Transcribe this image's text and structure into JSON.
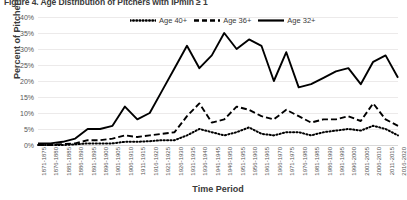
{
  "figure": {
    "title": "Figure 4. Age Distribution of Pitchers with IPmin ≥ 1"
  },
  "legend": {
    "position": "top-center",
    "entries": [
      {
        "label": "Age 40+",
        "style": "dotted",
        "color": "#000000"
      },
      {
        "label": "Age 36+",
        "style": "dashed",
        "color": "#000000"
      },
      {
        "label": "Age 32+",
        "style": "solid",
        "color": "#000000"
      }
    ]
  },
  "axes": {
    "y": {
      "title": "Percent of Pitchers",
      "ticks": [
        "0%",
        "5%",
        "10%",
        "15%",
        "20%",
        "25%",
        "30%",
        "35%",
        "40%"
      ]
    },
    "x": {
      "title": "Time Period"
    }
  },
  "chart_data": {
    "type": "line",
    "title": "Figure 4. Age Distribution of Pitchers with IPmin ≥ 1",
    "xlabel": "Time Period",
    "ylabel": "Percent of Pitchers",
    "ylim": [
      0,
      40
    ],
    "yticks": [
      0,
      5,
      10,
      15,
      20,
      25,
      30,
      35,
      40
    ],
    "ytick_labels": [
      "0%",
      "5%",
      "10%",
      "15%",
      "20%",
      "25%",
      "30%",
      "35%",
      "40%"
    ],
    "grid": true,
    "legend_position": "top-center",
    "categories": [
      "1871-1875",
      "1876-1880",
      "1881-1885",
      "1886-1890",
      "1891-1895",
      "1896-1900",
      "1901-1905",
      "1906-1910",
      "1911-1915",
      "1916-1920",
      "1921-1925",
      "1926-1930",
      "1931-1935",
      "1936-1940",
      "1941-1945",
      "1946-1950",
      "1951-1955",
      "1956-1960",
      "1961-1965",
      "1966-1970",
      "1971-1975",
      "1976-1980",
      "1981-1985",
      "1986-1990",
      "1991-1995",
      "1996-2000",
      "2001-2005",
      "2006-2010",
      "2011-2015",
      "2016-2020"
    ],
    "series": [
      {
        "name": "Age 32+",
        "style": "solid",
        "color": "#000000",
        "values": [
          0.5,
          0.5,
          1.0,
          2.0,
          5.0,
          5.0,
          6.0,
          12.0,
          8.0,
          10.0,
          17.0,
          24.0,
          31.0,
          24.0,
          28.0,
          35.0,
          30.0,
          33.0,
          31.0,
          20.0,
          29.0,
          18.0,
          19.0,
          21.0,
          23.0,
          24.0,
          19.0,
          26.0,
          28.0,
          21.0
        ]
      },
      {
        "name": "Age 36+",
        "style": "dashed",
        "color": "#000000",
        "values": [
          0.0,
          0.0,
          0.3,
          0.5,
          1.5,
          1.5,
          2.0,
          3.0,
          2.5,
          3.0,
          3.5,
          4.0,
          9.0,
          13.0,
          7.0,
          8.0,
          12.0,
          11.0,
          9.0,
          8.0,
          11.0,
          9.0,
          7.0,
          8.0,
          8.0,
          9.0,
          7.5,
          13.0,
          8.0,
          6.0
        ]
      },
      {
        "name": "Age 40+",
        "style": "dotted",
        "color": "#000000",
        "values": [
          0.0,
          0.0,
          0.0,
          0.2,
          0.5,
          0.5,
          0.5,
          1.0,
          1.0,
          1.2,
          1.5,
          1.5,
          3.0,
          5.0,
          4.0,
          3.0,
          4.0,
          5.5,
          3.5,
          3.0,
          4.0,
          4.0,
          3.0,
          4.0,
          4.5,
          5.0,
          4.5,
          6.0,
          5.0,
          3.0
        ]
      }
    ]
  }
}
